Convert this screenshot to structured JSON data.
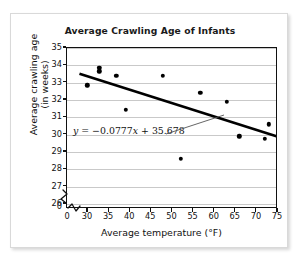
{
  "chart_data": {
    "type": "scatter",
    "title": "Average Crawling Age of Infants",
    "xlabel": "Average temperature (°F)",
    "ylabel_line1": "Average crawling age",
    "ylabel_line2": "(in weeks)",
    "xlim": [
      28,
      75
    ],
    "ylim": [
      25.8,
      35
    ],
    "xticks": [
      "0",
      "30",
      "35",
      "40",
      "45",
      "50",
      "55",
      "60",
      "65",
      "70",
      "75"
    ],
    "yticks": [
      "0",
      "26",
      "27",
      "28",
      "29",
      "30",
      "31",
      "32",
      "33",
      "34",
      "35"
    ],
    "grid": "horizontal",
    "axis_break": "both",
    "legend": "none",
    "points": [
      {
        "x": 29.8,
        "y": 32.85
      },
      {
        "x": 32.7,
        "y": 33.85
      },
      {
        "x": 32.7,
        "y": 33.65
      },
      {
        "x": 36.7,
        "y": 33.4
      },
      {
        "x": 39.0,
        "y": 31.45
      },
      {
        "x": 47.7,
        "y": 33.4
      },
      {
        "x": 52.0,
        "y": 28.6
      },
      {
        "x": 56.6,
        "y": 32.4
      },
      {
        "x": 62.8,
        "y": 31.9
      },
      {
        "x": 65.8,
        "y": 29.9
      },
      {
        "x": 71.9,
        "y": 29.75
      },
      {
        "x": 72.9,
        "y": 30.6
      }
    ],
    "trendline": {
      "slope": -0.0777,
      "intercept": 35.678,
      "equation_y": "y",
      "equation_rest": " = −0.0777",
      "equation_x": "x",
      "equation_tail": " + 35.678",
      "equation_full": "y = −0.0777x + 35.678"
    }
  }
}
